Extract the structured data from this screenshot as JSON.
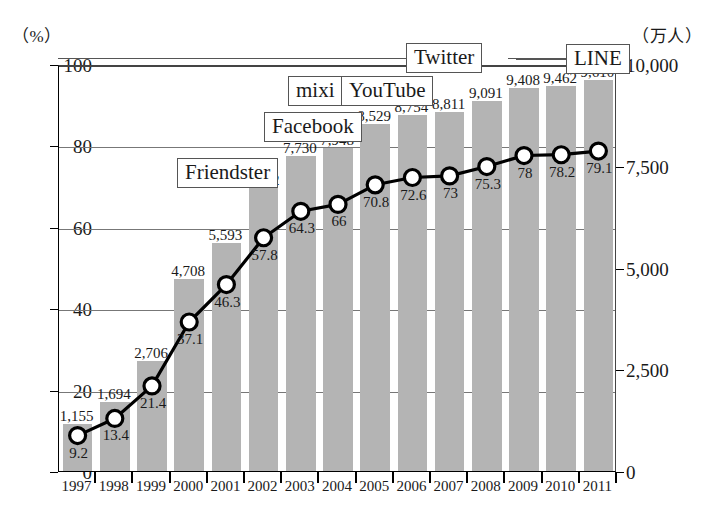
{
  "axes": {
    "left_unit": "（%）",
    "right_unit": "（万人）",
    "left_ticks": [
      "0",
      "20",
      "40",
      "60",
      "80",
      "100"
    ],
    "right_ticks": [
      "0",
      "2,500",
      "5,000",
      "7,500",
      "10,000"
    ],
    "x_labels": [
      "1997",
      "1998",
      "1999",
      "2000",
      "2001",
      "2002",
      "2003",
      "2004",
      "2005",
      "2006",
      "2007",
      "2008",
      "2009",
      "2010",
      "2011"
    ]
  },
  "annotations": [
    {
      "name": "friendster",
      "label": "Friendster"
    },
    {
      "name": "facebook",
      "label": "Facebook"
    },
    {
      "name": "mixi",
      "label": "mixi"
    },
    {
      "name": "youtube",
      "label": "YouTube"
    },
    {
      "name": "twitter",
      "label": "Twitter"
    },
    {
      "name": "line",
      "label": "LINE"
    }
  ],
  "colors": {
    "bar_fill": "#b4b4b4",
    "line_stroke": "#000000",
    "marker_fill": "#ffffff",
    "grid": "#777777",
    "axis": "#000000"
  },
  "chart_data": {
    "type": "bar",
    "title": "",
    "subtitle": "",
    "xlabel": "",
    "ylabel": "（%）",
    "y2label": "（万人）",
    "grid": true,
    "legend": "none",
    "categories": [
      "1997",
      "1998",
      "1999",
      "2000",
      "2001",
      "2002",
      "2003",
      "2004",
      "2005",
      "2006",
      "2007",
      "2008",
      "2009",
      "2010",
      "2011"
    ],
    "ylim": [
      0,
      100
    ],
    "y2lim": [
      0,
      10000
    ],
    "series": [
      {
        "name": "インターネット利用者数（万人）",
        "type": "bar",
        "axis": "right",
        "values": [
          1155,
          1694,
          2706,
          4708,
          5593,
          6942,
          7730,
          7948,
          8529,
          8754,
          8811,
          9091,
          9408,
          9462,
          9610
        ],
        "labels": [
          "1,155",
          "1,694",
          "2,706",
          "4,708",
          "5,593",
          "6,942",
          "7,730",
          "7,948",
          "8,529",
          "8,754",
          "8,811",
          "9,091",
          "9,408",
          "9,462",
          "9,610"
        ]
      },
      {
        "name": "人口普及率（%）",
        "type": "line",
        "axis": "left",
        "values": [
          9.2,
          13.4,
          21.4,
          37.1,
          46.3,
          57.8,
          64.3,
          66,
          70.8,
          72.6,
          73,
          75.3,
          78,
          78.2,
          79.1
        ],
        "labels": [
          "9.2",
          "13.4",
          "21.4",
          "37.1",
          "46.3",
          "57.8",
          "64.3",
          "66",
          "70.8",
          "72.6",
          "73",
          "75.3",
          "78",
          "78.2",
          "79.1"
        ]
      }
    ],
    "annotations": [
      "Friendster",
      "Facebook",
      "mixi",
      "YouTube",
      "Twitter",
      "LINE"
    ]
  }
}
